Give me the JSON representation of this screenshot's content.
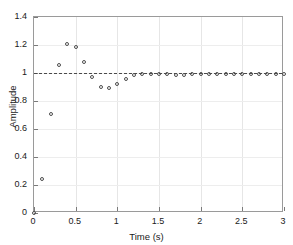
{
  "chart_data": {
    "type": "scatter",
    "title": "",
    "xlabel": "Time (s)",
    "ylabel": "Amplitude",
    "xlim": [
      0,
      3
    ],
    "ylim": [
      0,
      1.4
    ],
    "xticks": [
      0,
      0.5,
      1,
      1.5,
      2,
      2.5,
      3
    ],
    "xticklabels": [
      "0",
      "0.5",
      "1",
      "1.5",
      "2",
      "2.5",
      "3"
    ],
    "yticks": [
      0,
      0.2,
      0.4,
      0.6,
      0.8,
      1,
      1.2,
      1.4
    ],
    "yticklabels": [
      "0",
      "0.2",
      "0.4",
      "0.6",
      "0.8",
      "1",
      "1.2",
      "1.4"
    ],
    "grid": true,
    "legend": null,
    "marker": "open-circle",
    "marker_color": "#4d4d4d",
    "reference_line": {
      "axis": "y",
      "value": 1,
      "style": "dashed",
      "color": "#4a4a4a"
    },
    "series": [
      {
        "name": "Step response",
        "x": [
          0,
          0.1,
          0.2,
          0.3,
          0.4,
          0.5,
          0.6,
          0.7,
          0.8,
          0.9,
          1.0,
          1.1,
          1.2,
          1.3,
          1.4,
          1.5,
          1.6,
          1.7,
          1.8,
          1.9,
          2.0,
          2.1,
          2.2,
          2.3,
          2.4,
          2.5,
          2.6,
          2.7,
          2.8,
          2.9,
          3.0
        ],
        "y": [
          0.0,
          0.24,
          0.705,
          1.055,
          1.21,
          1.185,
          1.08,
          0.975,
          0.9,
          0.895,
          0.925,
          0.96,
          0.985,
          0.995,
          0.995,
          0.99,
          0.99,
          0.985,
          0.985,
          0.99,
          0.99,
          0.99,
          0.99,
          0.99,
          0.99,
          0.99,
          0.99,
          0.99,
          0.99,
          0.99,
          0.99
        ]
      }
    ]
  }
}
